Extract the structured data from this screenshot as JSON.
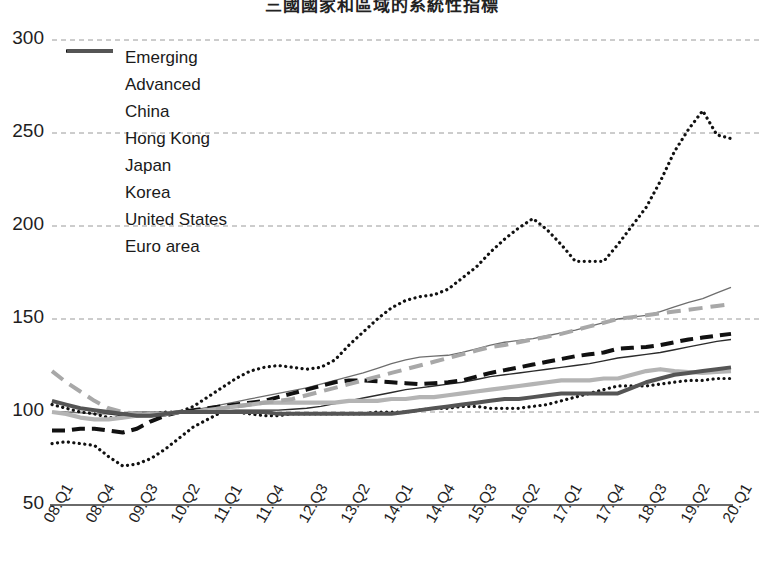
{
  "chart_data": {
    "type": "line",
    "title": "三國國家和區域的系統性指標",
    "xlabel": "",
    "ylabel": "",
    "ylim": [
      50,
      300
    ],
    "yticks": [
      50,
      100,
      150,
      200,
      250,
      300
    ],
    "grid": true,
    "legend_position": "top-left",
    "x": [
      "08.Q1",
      "08.Q2",
      "08.Q3",
      "08.Q4",
      "09.Q1",
      "09.Q2",
      "09.Q3",
      "09.Q4",
      "10.Q1",
      "10.Q2",
      "10.Q3",
      "10.Q4",
      "11.Q1",
      "11.Q2",
      "11.Q3",
      "11.Q4",
      "12.Q1",
      "12.Q2",
      "12.Q3",
      "12.Q4",
      "13.Q1",
      "13.Q2",
      "13.Q3",
      "13.Q4",
      "14.Q1",
      "14.Q2",
      "14.Q3",
      "14.Q4",
      "15.Q1",
      "15.Q2",
      "15.Q3",
      "15.Q4",
      "16.Q1",
      "16.Q2",
      "16.Q3",
      "16.Q4",
      "17.Q1",
      "17.Q2",
      "17.Q3",
      "17.Q4",
      "18.Q1",
      "18.Q2",
      "18.Q3",
      "18.Q4",
      "19.Q1",
      "19.Q2",
      "19.Q3",
      "19.Q4",
      "20.Q1"
    ],
    "xtick_labels": [
      "08.Q1",
      "08.Q4",
      "09.Q3",
      "10.Q2",
      "11.Q1",
      "11.Q4",
      "12.Q3",
      "13.Q2",
      "14.Q1",
      "14.Q4",
      "15.Q3",
      "16.Q2",
      "17.Q1",
      "17.Q4",
      "18.Q3",
      "19.Q2",
      "20.Q1"
    ],
    "xtick_indices": [
      0,
      3,
      6,
      9,
      12,
      15,
      18,
      21,
      24,
      27,
      30,
      33,
      36,
      39,
      42,
      45,
      48
    ],
    "series": [
      {
        "name": "Emerging",
        "style": "thin-solid-gray",
        "color": "#6e6e6e",
        "values": [
          100,
          100,
          99.5,
          99,
          99,
          99.5,
          100,
          100,
          100,
          100,
          101,
          102.5,
          104,
          105.5,
          107,
          108.5,
          110,
          111.5,
          113,
          115,
          117,
          119,
          121,
          123.5,
          126,
          128,
          129.5,
          130,
          130.5,
          132,
          134,
          136,
          137.5,
          138.5,
          139.5,
          141,
          142.5,
          144,
          146,
          148,
          150,
          151,
          152,
          154,
          156.5,
          159,
          161,
          164,
          167
        ]
      },
      {
        "name": "Advanced",
        "style": "thin-solid-dark",
        "color": "#2b2b2b",
        "values": [
          106,
          104,
          102,
          100.5,
          99,
          98,
          97.5,
          97.5,
          98,
          100,
          100,
          100,
          100.5,
          101,
          101,
          101,
          101,
          101.5,
          102,
          103,
          104.5,
          106,
          107.5,
          109,
          110.5,
          112,
          113,
          114,
          115,
          116,
          117.5,
          119,
          120,
          121,
          122,
          123,
          124,
          125,
          126,
          127.5,
          129,
          130,
          131,
          132,
          133.5,
          135,
          136.5,
          138,
          139
        ]
      },
      {
        "name": "China",
        "style": "thick-dash-black",
        "color": "#111111",
        "values": [
          90,
          90,
          91,
          91,
          90,
          89,
          91,
          95,
          98,
          100,
          101,
          102,
          103,
          104,
          105,
          106,
          108,
          110,
          112,
          114,
          116,
          117,
          117,
          116.5,
          116,
          115.5,
          115,
          115.5,
          116,
          117,
          119,
          121,
          122.5,
          124,
          125.5,
          127,
          128.5,
          130,
          131,
          132,
          134,
          134.5,
          135,
          136,
          137.5,
          139,
          140,
          141,
          142
        ]
      },
      {
        "name": "Hong Kong",
        "style": "dotted-black",
        "color": "#111111",
        "values": [
          104,
          102,
          100,
          99,
          97,
          97,
          98,
          99,
          100,
          100,
          103,
          108,
          113,
          118,
          122,
          124,
          125,
          124,
          123,
          124,
          128,
          136,
          143,
          150,
          156,
          160,
          162,
          163,
          166,
          172,
          178,
          186,
          193,
          199,
          204,
          198,
          190,
          181,
          181,
          181,
          190,
          200,
          210,
          224,
          240,
          252,
          262,
          249,
          247
        ]
      },
      {
        "name": "Japan",
        "style": "dotted-black",
        "color": "#111111",
        "values": [
          83,
          84,
          83,
          82,
          76,
          71,
          72,
          75,
          80,
          86,
          92,
          96,
          100,
          100,
          99,
          98,
          98,
          99,
          99,
          99,
          99,
          99,
          99,
          100,
          100,
          100,
          101,
          102,
          102,
          103,
          103,
          102,
          102,
          102,
          103,
          104,
          106,
          108,
          110,
          112,
          114,
          114,
          114,
          115,
          116,
          117,
          117,
          118,
          118
        ]
      },
      {
        "name": "Korea",
        "style": "thick-solid-lightgray",
        "color": "#b4b4b4",
        "values": [
          100,
          99,
          97,
          96,
          96,
          97,
          98,
          99,
          99,
          100,
          100,
          101,
          102,
          103,
          104,
          105,
          105,
          105,
          105,
          105,
          105,
          106,
          106,
          106,
          107,
          107,
          108,
          108,
          109,
          110,
          111,
          112,
          113,
          114,
          115,
          116,
          117,
          117,
          117,
          118,
          118,
          120,
          122,
          123,
          122,
          121.5,
          121,
          121.5,
          122
        ]
      },
      {
        "name": "United States",
        "style": "dash-gray",
        "color": "#a8a8a8",
        "values": [
          122,
          116,
          111,
          106,
          102,
          100,
          99,
          99,
          99,
          100,
          100,
          101,
          102,
          103,
          104,
          105,
          106,
          107,
          109,
          111,
          113,
          115,
          117,
          119,
          121,
          123,
          125,
          127,
          129,
          131,
          133,
          135,
          136,
          137.5,
          139,
          140.5,
          142,
          144,
          146,
          148,
          150,
          151,
          152,
          153,
          154,
          155,
          156,
          157,
          158
        ]
      },
      {
        "name": "Euro area",
        "style": "thick-solid-darkgray",
        "color": "#555555",
        "values": [
          106,
          104,
          102,
          101,
          100,
          99,
          98,
          98,
          99,
          100,
          100,
          100,
          100,
          100,
          100,
          100,
          99,
          99,
          99,
          99,
          99,
          99,
          99,
          99,
          99,
          100,
          101,
          102,
          103,
          104,
          105,
          106,
          107,
          107,
          108,
          109,
          110,
          110,
          110,
          110,
          110,
          113,
          116,
          118,
          120,
          121,
          122,
          123,
          124
        ]
      }
    ]
  },
  "axis": {
    "ylabels": [
      "300",
      "250",
      "200",
      "150",
      "100",
      "50"
    ]
  }
}
